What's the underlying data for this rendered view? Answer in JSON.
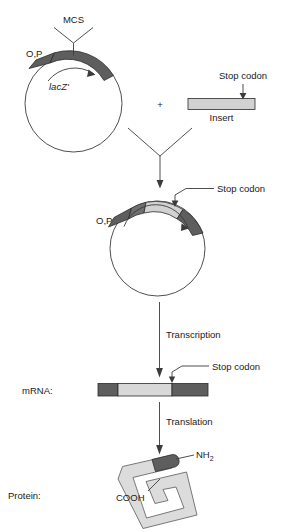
{
  "figure": {
    "type": "molecular-biology-schematic"
  },
  "colors": {
    "outline": "#3b3b3b",
    "segment_outline": "#2b2b2b",
    "dark_gray": "#5e5e5e",
    "mid_gray": "#7d7d7d",
    "light_gray": "#d2d2d2",
    "pale_gray": "#e2e2e2",
    "background": "#ffffff",
    "text": "#1a1a1a"
  },
  "top_vector": {
    "mcs_label": "MCS",
    "op_label": "O,P",
    "lacz_label": "lacZ'"
  },
  "insert_unit": {
    "plus_sign": "+",
    "stop_codon_label": "Stop codon",
    "insert_label": "Insert"
  },
  "recombinant_vector": {
    "op_label": "O,P",
    "stop_codon_label": "Stop codon"
  },
  "steps": {
    "transcription_label": "Transcription",
    "translation_label": "Translation"
  },
  "mrna": {
    "row_label": "mRNA:",
    "stop_codon_label": "Stop codon"
  },
  "protein": {
    "row_label": "Protein:",
    "n_terminus_label": "NH",
    "n_terminus_sub": "2",
    "c_terminus_label": "COOH"
  }
}
